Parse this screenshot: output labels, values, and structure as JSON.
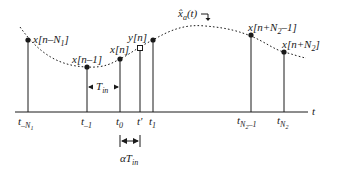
{
  "diagram": {
    "colors": {
      "ink": "#1a1a1a",
      "background": "#ffffff"
    },
    "axis": {
      "label": "t"
    },
    "curve": {
      "label_base": "x̂",
      "label_sub": "a",
      "label_tail": "(t)"
    },
    "samples": [
      {
        "id": "x_n_minus_N1",
        "label_pre": "x[n–N",
        "label_sub": "1",
        "label_post": "]",
        "tick_base": "t",
        "tick_sub": "–N",
        "tick_subsub": "1",
        "marker": "dot"
      },
      {
        "id": "x_n_minus_1",
        "label_pre": "x[n–1]",
        "label_sub": "",
        "label_post": "",
        "tick_base": "t",
        "tick_sub": "–1",
        "marker": "dot"
      },
      {
        "id": "x_n",
        "label_pre": "x[n]",
        "label_sub": "",
        "label_post": "",
        "tick_base": "t",
        "tick_sub": "0",
        "marker": "dot"
      },
      {
        "id": "y_n",
        "label_pre": "y[n]",
        "label_sub": "",
        "label_post": "",
        "tick_base": "t'",
        "tick_sub": "",
        "marker": "square"
      },
      {
        "id": "x_t1",
        "label_pre": "",
        "label_sub": "",
        "label_post": "",
        "tick_base": "t",
        "tick_sub": "1",
        "marker": "dot"
      },
      {
        "id": "x_n_plus_N2_minus_1",
        "label_pre": "x[n+N",
        "label_sub": "2",
        "label_post": "–1]",
        "tick_base": "t",
        "tick_sub": "N",
        "tick_subsub": "2",
        "tick_tail": "–1",
        "marker": "dot"
      },
      {
        "id": "x_n_plus_N2",
        "label_pre": "x[n+N",
        "label_sub": "2",
        "label_post": "]",
        "tick_base": "t",
        "tick_sub": "N",
        "tick_subsub": "2",
        "marker": "dot"
      }
    ],
    "intervals": {
      "t_in": {
        "base": "T",
        "sub": "in"
      },
      "alpha_t_in": {
        "prefix": "α",
        "base": "T",
        "sub": "in"
      }
    }
  }
}
